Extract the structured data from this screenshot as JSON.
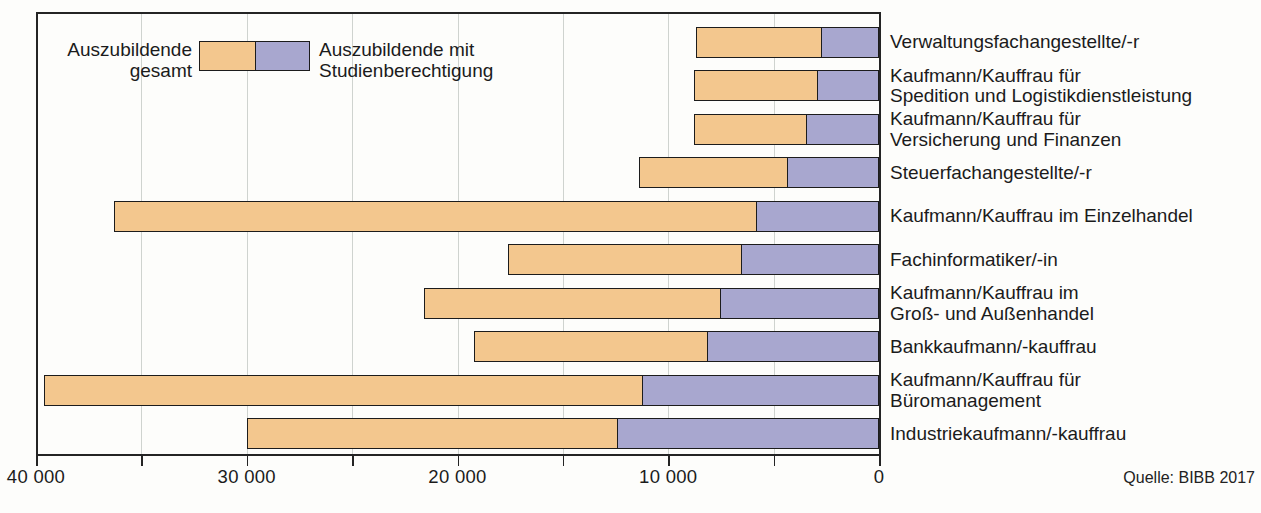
{
  "legend": {
    "total": "Auszubildende\ngesamt",
    "with_qualification": "Auszubildende mit\nStudienberechtigung"
  },
  "source": "Quelle: BIBB 2017",
  "colors": {
    "total_fill": "#f3c78e",
    "qualification_fill": "#a8a7cf",
    "bar_border": "#1c1c1c",
    "frame_border": "#242424",
    "gridline": "#cfd3cf",
    "background": "#fdfdfb",
    "text": "#1b1b1b"
  },
  "chart_data": {
    "type": "bar",
    "orientation": "horizontal",
    "axis_reversed": true,
    "title": "",
    "xlabel": "",
    "ylabel": "",
    "xlim": [
      0,
      40000
    ],
    "grid_interval": 5000,
    "tick_interval": 5000,
    "xticks_labeled": [
      40000,
      30000,
      20000,
      10000,
      0
    ],
    "xtick_labels": [
      "40 000",
      "30 000",
      "20 000",
      "10 000",
      "0"
    ],
    "legend_position": "top-left-inside",
    "categories": [
      "Verwaltungsfachangestellte/-r",
      "Kaufmann/Kauffrau für\nSpedition und Logistikdienstleistung",
      "Kaufmann/Kauffrau für\nVersicherung und Finanzen",
      "Steuerfachangestellte/-r",
      "Kaufmann/Kauffrau im Einzelhandel",
      "Fachinformatiker/-in",
      "Kaufmann/Kauffrau im\nGroß- und Außenhandel",
      "Bankkaufmann/-kauffrau",
      "Kaufmann/Kauffrau für\nBüromanagement",
      "Industriekaufmann/-kauffrau"
    ],
    "series": [
      {
        "name": "Auszubildende gesamt",
        "values": [
          8700,
          8800,
          8800,
          11400,
          36300,
          17600,
          21600,
          19200,
          39600,
          30000
        ]
      },
      {
        "name": "Auszubildende mit Studienberechtigung",
        "values": [
          2700,
          2900,
          3400,
          4300,
          5800,
          6500,
          7500,
          8100,
          11200,
          12400
        ]
      }
    ]
  }
}
